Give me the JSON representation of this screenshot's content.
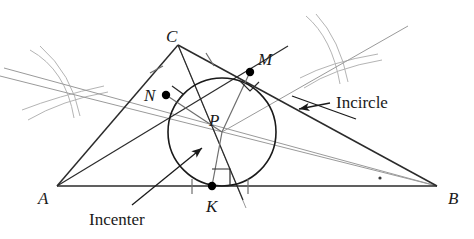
{
  "figure": {
    "background": "#ffffff",
    "width": 474,
    "height": 239,
    "colors": {
      "triangle_stroke": "#2b2b2b",
      "circle_stroke": "#1a1a1a",
      "bisector_stroke": "#9a9a9a",
      "arc_stroke": "#b4b4b4",
      "radius_stroke": "#6e6e6e",
      "point_fill": "#000000",
      "label_color": "#1a1a1a",
      "leader_stroke": "#1a1a1a"
    }
  },
  "triangle": {
    "name": "ABC",
    "vertices": [
      {
        "id": "A",
        "label": "A",
        "x": 57,
        "y": 186,
        "label_x": 38,
        "label_y": 190
      },
      {
        "id": "B",
        "label": "B",
        "x": 437,
        "y": 186,
        "label_x": 448,
        "label_y": 190
      },
      {
        "id": "C",
        "label": "C",
        "x": 178,
        "y": 45,
        "label_x": 166,
        "label_y": 28
      }
    ]
  },
  "incircle": {
    "center": {
      "id": "P",
      "label": "P",
      "x": 222,
      "y": 132,
      "label_x": 209,
      "label_y": 118
    },
    "radius": 54,
    "tangent_points": [
      {
        "id": "N",
        "label": "N",
        "x": 166,
        "y": 95,
        "label_x": 144,
        "label_y": 96,
        "side": "AC"
      },
      {
        "id": "M",
        "label": "M",
        "x": 250,
        "y": 72,
        "label_x": 258,
        "label_y": 60,
        "side": "CB"
      },
      {
        "id": "K",
        "label": "K",
        "x": 212,
        "y": 186,
        "label_x": 206,
        "label_y": 209,
        "side": "AB"
      }
    ]
  },
  "callouts": [
    {
      "id": "incircle-callout",
      "text": "Incircle",
      "text_x": 336,
      "text_y": 96,
      "leader_from_x": 330,
      "leader_from_y": 103,
      "arrow_x": 297,
      "arrow_y": 110
    },
    {
      "id": "incenter-callout",
      "text": "Incenter",
      "text_x": 89,
      "text_y": 213,
      "leader_from_x": 132,
      "leader_from_y": 205,
      "arrow_x": 200,
      "arrow_y": 150
    }
  ],
  "markers": {
    "right_angle_label": "right-angle-marker",
    "tick_label": "congruence-tick",
    "bisector_dot_label": "angle-bisector-dot"
  }
}
